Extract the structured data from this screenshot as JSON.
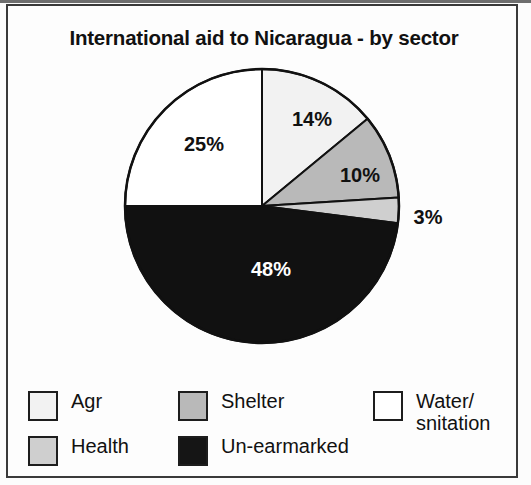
{
  "chart_data": {
    "type": "pie",
    "title": "International aid to Nicaragua - by sector",
    "categories": [
      "Agr",
      "Shelter",
      "Health",
      "Un-earmarked",
      "Water/snitation"
    ],
    "values": [
      14,
      10,
      3,
      48,
      25
    ],
    "value_labels": [
      "14%",
      "10%",
      "3%",
      "48%",
      "25%"
    ],
    "unit": "%",
    "start_angle_deg": 0,
    "direction": "clockwise",
    "legend_position": "bottom",
    "grid": false,
    "slices": [
      {
        "label": "Agr",
        "value": 14,
        "value_label": "14%",
        "color": "#f2f2f2",
        "start_angle_deg": 0,
        "end_angle_deg": 50.4,
        "label_x": 304,
        "label_y": 113,
        "label_on_dark": false
      },
      {
        "label": "Shelter",
        "value": 10,
        "value_label": "10%",
        "color": "#b9b9b9",
        "start_angle_deg": 50.4,
        "end_angle_deg": 86.4,
        "label_x": 352,
        "label_y": 169,
        "label_on_dark": false
      },
      {
        "label": "Health",
        "value": 3,
        "value_label": "3%",
        "color": "#cfcfcf",
        "start_angle_deg": 86.4,
        "end_angle_deg": 97.2,
        "label_x": 420,
        "label_y": 211,
        "label_on_dark": false
      },
      {
        "label": "Un-earmarked",
        "value": 48,
        "value_label": "48%",
        "color": "#111111",
        "start_angle_deg": 97.2,
        "end_angle_deg": 270,
        "label_x": 263,
        "label_y": 263,
        "label_on_dark": true
      },
      {
        "label": "Water/snitation",
        "value": 25,
        "value_label": "25%",
        "color": "#ffffff",
        "start_angle_deg": 270,
        "end_angle_deg": 360,
        "label_x": 196,
        "label_y": 138,
        "label_on_dark": false
      }
    ],
    "legend": [
      {
        "label": "Agr",
        "color": "#f2f2f2"
      },
      {
        "label": "Shelter",
        "color": "#b9b9b9"
      },
      {
        "label": "Water/\nsnitation",
        "color": "#ffffff"
      },
      {
        "label": "Health",
        "color": "#cfcfcf"
      },
      {
        "label": "Un-earmarked",
        "color": "#151515"
      }
    ]
  },
  "figure": {
    "title": "International aid to Nicaragua - by sector",
    "border_color": "#3a3a3a",
    "background_color": "#fdfdfd",
    "outline_color": "#111111"
  },
  "pie_geometry": {
    "center_x": 254,
    "center_y": 200,
    "radius": 137
  }
}
